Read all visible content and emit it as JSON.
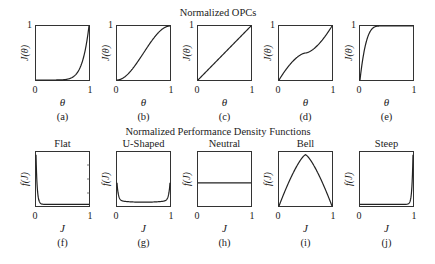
{
  "figure": {
    "top_title": "Normalized OPCs",
    "bottom_title": "Normalized Performance Density Functions"
  },
  "chart_data": [
    {
      "id": "a",
      "type": "line",
      "caption": "(a)",
      "xlabel": "θ",
      "ylabel": "J(θ)",
      "xticks": [
        "0",
        "1"
      ],
      "yticks": [
        "1"
      ],
      "xlim": [
        0,
        1
      ],
      "ylim": [
        0,
        1
      ],
      "shape": "convex power curve (steep rise near θ=1)",
      "x": [
        0,
        0.5,
        0.7,
        0.8,
        0.9,
        0.95,
        1
      ],
      "y": [
        0,
        0.001,
        0.02,
        0.07,
        0.25,
        0.5,
        1
      ]
    },
    {
      "id": "b",
      "type": "line",
      "caption": "(b)",
      "xlabel": "θ",
      "ylabel": "J(θ)",
      "xticks": [
        "0",
        "1"
      ],
      "yticks": [
        "1"
      ],
      "xlim": [
        0,
        1
      ],
      "ylim": [
        0,
        1
      ],
      "shape": "S-shaped (sigmoid)",
      "x": [
        0,
        0.2,
        0.4,
        0.5,
        0.6,
        0.8,
        1
      ],
      "y": [
        0,
        0.1,
        0.35,
        0.5,
        0.65,
        0.9,
        1
      ]
    },
    {
      "id": "c",
      "type": "line",
      "caption": "(c)",
      "xlabel": "θ",
      "ylabel": "J(θ)",
      "xticks": [
        "0",
        "1"
      ],
      "yticks": [
        "1"
      ],
      "xlim": [
        0,
        1
      ],
      "ylim": [
        0,
        1
      ],
      "shape": "linear",
      "x": [
        0,
        1
      ],
      "y": [
        0,
        1
      ]
    },
    {
      "id": "d",
      "type": "line",
      "caption": "(d)",
      "xlabel": "θ",
      "ylabel": "J(θ)",
      "xticks": [
        "0",
        "1"
      ],
      "yticks": [
        "1"
      ],
      "xlim": [
        0,
        1
      ],
      "ylim": [
        0,
        1
      ],
      "shape": "inverse S-shaped",
      "x": [
        0,
        0.1,
        0.3,
        0.5,
        0.7,
        0.9,
        1
      ],
      "y": [
        0,
        0.2,
        0.37,
        0.5,
        0.63,
        0.8,
        1
      ]
    },
    {
      "id": "e",
      "type": "line",
      "caption": "(e)",
      "xlabel": "θ",
      "ylabel": "J(θ)",
      "xticks": [
        "0",
        "1"
      ],
      "yticks": [
        "1"
      ],
      "xlim": [
        0,
        1
      ],
      "ylim": [
        0,
        1
      ],
      "shape": "concave (rapid saturation)",
      "x": [
        0,
        0.05,
        0.1,
        0.2,
        0.3,
        0.4,
        1
      ],
      "y": [
        0,
        0.55,
        0.78,
        0.95,
        0.99,
        1,
        1
      ]
    },
    {
      "id": "f",
      "type": "line",
      "title": "Flat",
      "caption": "(f)",
      "xlabel": "J",
      "ylabel": "f(J)",
      "xticks": [
        "0",
        "1"
      ],
      "xlim": [
        0,
        1
      ],
      "shape": "sharp spike at J=0, then near zero",
      "x": [
        0,
        0.02,
        0.05,
        0.1,
        0.5,
        1
      ],
      "y": [
        0.95,
        0.5,
        0.15,
        0.06,
        0.03,
        0.02
      ]
    },
    {
      "id": "g",
      "type": "line",
      "title": "U-Shaped",
      "caption": "(g)",
      "xlabel": "J",
      "ylabel": "f(J)",
      "xticks": [
        "0",
        "1"
      ],
      "xlim": [
        0,
        1
      ],
      "shape": "U-shaped",
      "x": [
        0,
        0.03,
        0.1,
        0.5,
        0.9,
        0.97,
        1
      ],
      "y": [
        0.4,
        0.18,
        0.1,
        0.07,
        0.1,
        0.18,
        0.4
      ]
    },
    {
      "id": "h",
      "type": "line",
      "title": "Neutral",
      "caption": "(h)",
      "xlabel": "J",
      "ylabel": "f(J)",
      "xticks": [
        "0",
        "1"
      ],
      "xlim": [
        0,
        1
      ],
      "shape": "constant (uniform)",
      "x": [
        0,
        1
      ],
      "y": [
        0.43,
        0.43
      ]
    },
    {
      "id": "i",
      "type": "line",
      "title": "Bell",
      "caption": "(i)",
      "xlabel": "J",
      "ylabel": "f(J)",
      "xticks": [
        "0",
        "1"
      ],
      "xlim": [
        0,
        1
      ],
      "shape": "peaked at J=0.5",
      "x": [
        0,
        0.25,
        0.5,
        0.75,
        1
      ],
      "y": [
        0,
        0.62,
        0.95,
        0.62,
        0
      ]
    },
    {
      "id": "j",
      "type": "line",
      "title": "Steep",
      "caption": "(j)",
      "xlabel": "J",
      "ylabel": "f(J)",
      "xticks": [
        "0",
        "1"
      ],
      "xlim": [
        0,
        1
      ],
      "shape": "sharp spike at J=1",
      "x": [
        0,
        0.5,
        0.9,
        0.95,
        0.98,
        1
      ],
      "y": [
        0.02,
        0.03,
        0.06,
        0.15,
        0.5,
        0.95
      ]
    }
  ]
}
